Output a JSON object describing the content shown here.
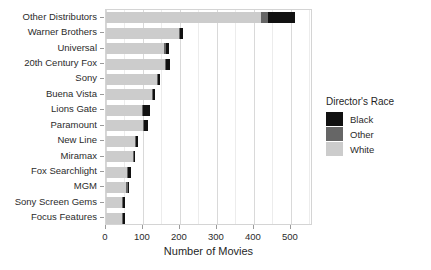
{
  "chart_data": {
    "type": "bar",
    "orientation": "horizontal",
    "stacked": true,
    "title": "",
    "xlabel": "Number of Movies",
    "ylabel": "",
    "xlim": [
      0,
      560
    ],
    "xticks": [
      0,
      100,
      200,
      300,
      400,
      500
    ],
    "xticklabels": [
      "0",
      "100",
      "200",
      "300",
      "400",
      "500"
    ],
    "minor_xticks": [
      50,
      150,
      250,
      350,
      450,
      550
    ],
    "grid": true,
    "legend_title": "Director's Race",
    "legend_position": "right",
    "categories": [
      "Other Distributors",
      "Warner Brothers",
      "Universal",
      "20th Century Fox",
      "Sony",
      "Buena Vista",
      "Lions Gate",
      "Paramount",
      "New Line",
      "Miramax",
      "Fox Searchlight",
      "MGM",
      "Sony Screen Gems",
      "Focus Features"
    ],
    "series": [
      {
        "name": "White",
        "color": "#cccccc",
        "values": [
          420,
          198,
          158,
          160,
          138,
          125,
          98,
          100,
          78,
          72,
          57,
          55,
          43,
          44
        ]
      },
      {
        "name": "Other",
        "color": "#666666",
        "values": [
          18,
          2,
          2,
          2,
          2,
          2,
          2,
          2,
          2,
          1,
          1,
          1,
          1,
          1
        ]
      },
      {
        "name": "Black",
        "color": "#111111",
        "values": [
          72,
          8,
          8,
          9,
          5,
          5,
          17,
          11,
          5,
          2,
          8,
          4,
          5,
          3
        ]
      }
    ],
    "totals": [
      510,
      208,
      168,
      171,
      145,
      132,
      117,
      113,
      85,
      75,
      66,
      60,
      49,
      48
    ]
  },
  "legend": {
    "title": "Director's Race",
    "items": [
      {
        "label": "Black",
        "color": "#111111"
      },
      {
        "label": "Other",
        "color": "#666666"
      },
      {
        "label": "White",
        "color": "#cccccc"
      }
    ]
  },
  "axes": {
    "x_title": "Number of Movies"
  }
}
